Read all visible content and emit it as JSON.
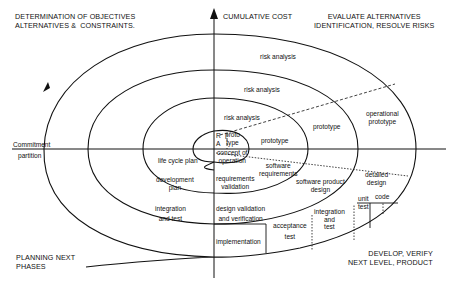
{
  "quadrants": {
    "top_left": "DETERMINATION OF OBJECTIVES\nALTERNATIVES &  CONSTRAINTS.",
    "top_right": "EVALUATE ALTERNATIVES\nIDENTIFICATION, RESOLVE RISKS",
    "bottom_left": "PLANNING NEXT\nPHASES",
    "bottom_right": "DEVELOP, VERIFY\nNEXT LEVEL, PRODUCT"
  },
  "axes": {
    "vertical_label": "CUMULATIVE COST",
    "horizontal_label_top": "Commitment",
    "horizontal_label_bottom": "partition"
  },
  "risk_analysis": [
    "risk analysis",
    "risk analysis",
    "risk analysis"
  ],
  "ra_marker": {
    "r": "R",
    "a": "A"
  },
  "prototypes": {
    "proto1": "proto\ntype",
    "proto2": "prototype",
    "proto3": "prototype",
    "operational": "operational\nprototype"
  },
  "planning": {
    "life_cycle": "life cycle plan",
    "development": "development\nplan",
    "integration": "integration\nand test"
  },
  "develop": {
    "concept": "concept of\noperation",
    "software_requirements": "software\nrequirements",
    "requirements_validation": "requirements\nvalidation",
    "software_product_design": "software product\ndesign",
    "design_validation": "design validation\nand verification",
    "detailed_design": "detailed\ndesign",
    "code": "code",
    "unit_test": "unit\ntest",
    "integration_test": "integration\nand\ntest",
    "acceptance_test": "acceptance\ntest",
    "implementation": "implementation"
  },
  "colors": {
    "ink": "#111111",
    "background": "#ffffff"
  }
}
